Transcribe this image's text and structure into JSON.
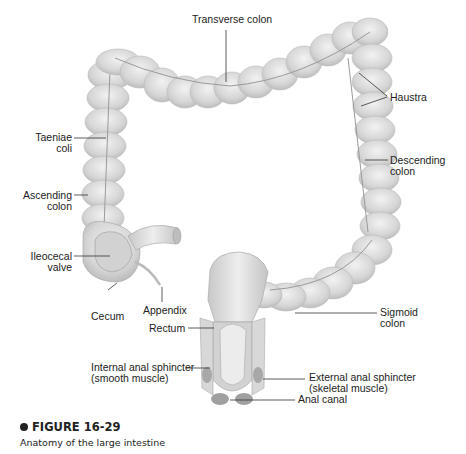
{
  "figure": {
    "number_label": "FIGURE 16-29",
    "caption": "Anatomy of the large intestine",
    "colors": {
      "tissue_fill": "#d9d9d9",
      "tissue_shadow": "#b8b8b8",
      "leader_line": "#333333",
      "text": "#222222"
    }
  },
  "labels": {
    "transverse_colon": "Transverse colon",
    "haustra": "Haustra",
    "taeniae_coli": "Taeniae\ncoli",
    "descending_colon": "Descending\ncolon",
    "ascending_colon": "Ascending\ncolon",
    "ileocecal_valve": "Ileocecal\nvalve",
    "appendix": "Appendix",
    "cecum": "Cecum",
    "rectum": "Rectum",
    "sigmoid_colon": "Sigmoid\ncolon",
    "internal_anal_sphincter": "Internal anal sphincter\n(smooth muscle)",
    "external_anal_sphincter": "External anal sphincter\n(skeletal muscle)",
    "anal_canal": "Anal canal"
  }
}
